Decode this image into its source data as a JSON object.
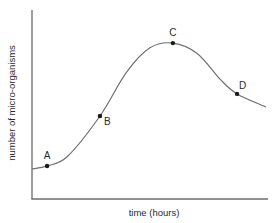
{
  "chart_data": {
    "type": "line",
    "title": "",
    "xlabel": "time (hours)",
    "ylabel": "number of micro-organisms",
    "xlim": [
      0,
      100
    ],
    "ylim": [
      0,
      100
    ],
    "grid": false,
    "ticks": false,
    "note": "Qualitative growth curve; axes have no tick marks or numeric labels. Values are in relative units.",
    "series": [
      {
        "name": "population",
        "x": [
          0,
          6.4,
          15,
          28.8,
          40,
          50,
          59.7,
          70,
          80,
          86.9,
          99.2
        ],
        "y": [
          15.9,
          17.5,
          22.5,
          43.9,
          67,
          80,
          82.5,
          77,
          63,
          55.6,
          48.7
        ],
        "color": "#707070"
      }
    ],
    "points": [
      {
        "label": "A",
        "x": 6.4,
        "y": 17.5,
        "label_pos": "above"
      },
      {
        "label": "B",
        "x": 28.8,
        "y": 43.9,
        "label_pos": "below-right"
      },
      {
        "label": "C",
        "x": 59.7,
        "y": 82.5,
        "label_pos": "above"
      },
      {
        "label": "D",
        "x": 86.9,
        "y": 55.6,
        "label_pos": "above-right"
      }
    ]
  }
}
